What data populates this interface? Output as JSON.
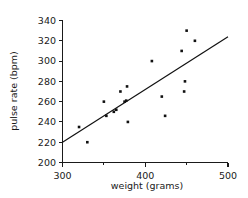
{
  "chart_data": {
    "type": "scatter",
    "title": "",
    "xlabel": "weight (grams)",
    "ylabel": "pulse rate (bpm)",
    "xlim": [
      300,
      500
    ],
    "ylim": [
      200,
      340
    ],
    "grid": false,
    "legend": null,
    "x_ticks_major": [
      300,
      400,
      500
    ],
    "x_ticks_minor": [
      350,
      450
    ],
    "y_ticks_major": [
      200,
      220,
      240,
      260,
      280,
      300,
      320,
      340
    ],
    "x_tick_labels": [
      "300",
      "400",
      "500"
    ],
    "y_tick_labels": [
      "200",
      "220",
      "240",
      "260",
      "280",
      "300",
      "320",
      "340"
    ],
    "points": [
      {
        "x": 320,
        "y": 235
      },
      {
        "x": 330,
        "y": 220
      },
      {
        "x": 350,
        "y": 260
      },
      {
        "x": 353,
        "y": 246
      },
      {
        "x": 362,
        "y": 250
      },
      {
        "x": 365,
        "y": 252
      },
      {
        "x": 370,
        "y": 270
      },
      {
        "x": 375,
        "y": 260
      },
      {
        "x": 377,
        "y": 261
      },
      {
        "x": 378,
        "y": 275
      },
      {
        "x": 379,
        "y": 240
      },
      {
        "x": 408,
        "y": 300
      },
      {
        "x": 420,
        "y": 265
      },
      {
        "x": 424,
        "y": 246
      },
      {
        "x": 444,
        "y": 310
      },
      {
        "x": 447,
        "y": 270
      },
      {
        "x": 448,
        "y": 280
      },
      {
        "x": 450,
        "y": 330
      },
      {
        "x": 460,
        "y": 320
      }
    ],
    "trend_line": {
      "label": "line of best fit",
      "x_start": 300,
      "y_start": 220,
      "x_end": 500,
      "y_end": 324
    },
    "marker": {
      "shape": "square",
      "size_px": 2.6,
      "color": "#111111"
    },
    "colors": {
      "axis": "#1a1a1a",
      "point": "#111111",
      "line": "#111111",
      "background": "#ffffff"
    }
  }
}
